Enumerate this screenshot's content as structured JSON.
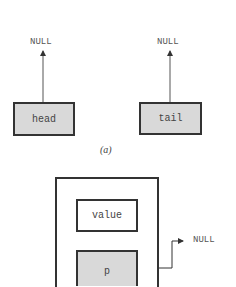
{
  "diagram": {
    "part_a": {
      "caption": "(a)",
      "head": {
        "label": "head",
        "points_to": "NULL"
      },
      "tail": {
        "label": "tail",
        "points_to": "NULL"
      }
    },
    "part_b": {
      "node": {
        "value_label": "value",
        "pointer_label": "p",
        "pointer_target": "NULL"
      }
    },
    "colors": {
      "box_fill_pointer": "#d9d9d9",
      "box_fill_value": "#ffffff",
      "stroke": "#333333",
      "text": "#555555"
    }
  }
}
